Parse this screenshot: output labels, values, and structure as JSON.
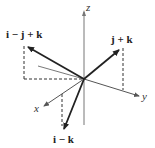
{
  "diagram": {
    "type": "3d-vector-diagram",
    "axes": {
      "x": "x",
      "y": "y",
      "z": "z"
    },
    "vectors": [
      {
        "id": "i-minus-j-plus-k",
        "label": "i − j + k"
      },
      {
        "id": "j-plus-k",
        "label": "j + k"
      },
      {
        "id": "i-minus-k",
        "label": "i − k"
      }
    ],
    "colors": {
      "vector": "#222222",
      "axis": "#555555",
      "dashed": "#333333",
      "background": "#ffffff"
    }
  }
}
